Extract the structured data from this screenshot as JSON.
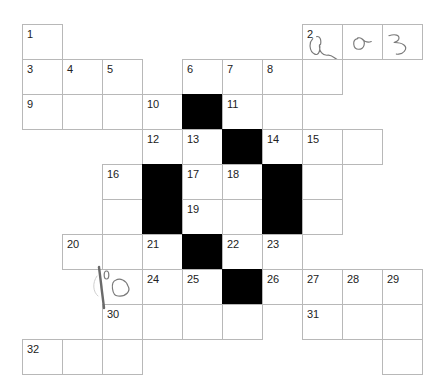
{
  "puzzle": {
    "type": "crossword",
    "origin": {
      "x": 22,
      "y": 24
    },
    "cell_width": 40,
    "cell_height": 35,
    "colors": {
      "black_cell": "#000000",
      "border": "#b8b8b8",
      "number": "#222222",
      "handwriting": "#7a7a7a"
    },
    "cells": [
      {
        "r": 0,
        "c": 0,
        "num": "1"
      },
      {
        "r": 0,
        "c": 7,
        "num": "2",
        "entry": "q"
      },
      {
        "r": 0,
        "c": 8,
        "entry": "a"
      },
      {
        "r": 0,
        "c": 9,
        "entry": "3"
      },
      {
        "r": 1,
        "c": 0,
        "num": "3"
      },
      {
        "r": 1,
        "c": 1,
        "num": "4"
      },
      {
        "r": 1,
        "c": 2,
        "num": "5"
      },
      {
        "r": 1,
        "c": 4,
        "num": "6"
      },
      {
        "r": 1,
        "c": 5,
        "num": "7"
      },
      {
        "r": 1,
        "c": 6,
        "num": "8"
      },
      {
        "r": 1,
        "c": 7
      },
      {
        "r": 2,
        "c": 0,
        "num": "9"
      },
      {
        "r": 2,
        "c": 1
      },
      {
        "r": 2,
        "c": 2
      },
      {
        "r": 2,
        "c": 3,
        "num": "10"
      },
      {
        "r": 2,
        "c": 4,
        "black": true
      },
      {
        "r": 2,
        "c": 5,
        "num": "11"
      },
      {
        "r": 2,
        "c": 6
      },
      {
        "r": 3,
        "c": 3,
        "num": "12"
      },
      {
        "r": 3,
        "c": 4,
        "num": "13"
      },
      {
        "r": 3,
        "c": 5,
        "black": true
      },
      {
        "r": 3,
        "c": 6,
        "num": "14"
      },
      {
        "r": 3,
        "c": 7,
        "num": "15"
      },
      {
        "r": 3,
        "c": 8
      },
      {
        "r": 4,
        "c": 2,
        "num": "16"
      },
      {
        "r": 4,
        "c": 3,
        "black": true
      },
      {
        "r": 4,
        "c": 4,
        "num": "17"
      },
      {
        "r": 4,
        "c": 5,
        "num": "18"
      },
      {
        "r": 4,
        "c": 6,
        "black": true
      },
      {
        "r": 4,
        "c": 7
      },
      {
        "r": 5,
        "c": 2
      },
      {
        "r": 5,
        "c": 3,
        "black": true
      },
      {
        "r": 5,
        "c": 4,
        "num": "19"
      },
      {
        "r": 5,
        "c": 5
      },
      {
        "r": 5,
        "c": 6,
        "black": true
      },
      {
        "r": 5,
        "c": 7
      },
      {
        "r": 6,
        "c": 1,
        "num": "20"
      },
      {
        "r": 6,
        "c": 2
      },
      {
        "r": 6,
        "c": 3,
        "num": "21"
      },
      {
        "r": 6,
        "c": 4,
        "black": true
      },
      {
        "r": 6,
        "c": 5,
        "num": "22"
      },
      {
        "r": 6,
        "c": 6,
        "num": "23"
      },
      {
        "r": 7,
        "c": 3,
        "num": "24"
      },
      {
        "r": 7,
        "c": 4,
        "num": "25"
      },
      {
        "r": 7,
        "c": 5,
        "black": true
      },
      {
        "r": 7,
        "c": 6,
        "num": "26"
      },
      {
        "r": 7,
        "c": 7,
        "num": "27"
      },
      {
        "r": 7,
        "c": 8,
        "num": "28"
      },
      {
        "r": 7,
        "c": 9,
        "num": "29"
      },
      {
        "r": 8,
        "c": 2,
        "num": "30"
      },
      {
        "r": 8,
        "c": 3
      },
      {
        "r": 8,
        "c": 4
      },
      {
        "r": 8,
        "c": 5
      },
      {
        "r": 8,
        "c": 7,
        "num": "31"
      },
      {
        "r": 8,
        "c": 8
      },
      {
        "r": 8,
        "c": 9
      },
      {
        "r": 9,
        "c": 0,
        "num": "32"
      },
      {
        "r": 9,
        "c": 1
      },
      {
        "r": 9,
        "c": 2
      },
      {
        "r": 9,
        "c": 9
      }
    ],
    "margin_annotation": {
      "text": "10",
      "x": 95,
      "y": 268
    }
  }
}
